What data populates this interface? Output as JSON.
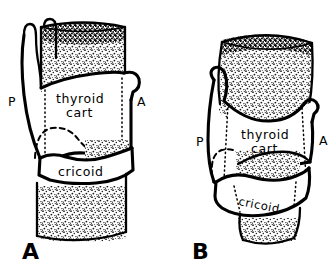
{
  "figure": {
    "background_color": "#ffffff",
    "ink_color": "#000000",
    "width": 332,
    "height": 270
  },
  "panels": [
    {
      "id": "panel-a",
      "letter": "A",
      "orientation": "frontal / lateral view, larynx upright",
      "labels": {
        "posterior": "P",
        "anterior": "A",
        "thyroid_line1": "thyroid",
        "thyroid_line2": "cart",
        "cricoid": "cricoid"
      }
    },
    {
      "id": "panel-b",
      "letter": "B",
      "orientation": "oblique / tilted view, larynx rotated",
      "labels": {
        "posterior": "P",
        "anterior": "A",
        "thyroid_line1": "thyroid",
        "thyroid_line2": "cart",
        "cricoid": "cricoid"
      }
    }
  ],
  "structures": [
    {
      "name": "trachea",
      "rendering": "stippled / speckled texture"
    },
    {
      "name": "thyroid-cartilage",
      "rendering": "white outlined plate"
    },
    {
      "name": "cricoid-cartilage",
      "rendering": "white outlined ring"
    },
    {
      "name": "superior-cornu",
      "rendering": "thin horn outlines"
    },
    {
      "name": "inferior-cornu",
      "rendering": "dashed hidden outline"
    }
  ]
}
